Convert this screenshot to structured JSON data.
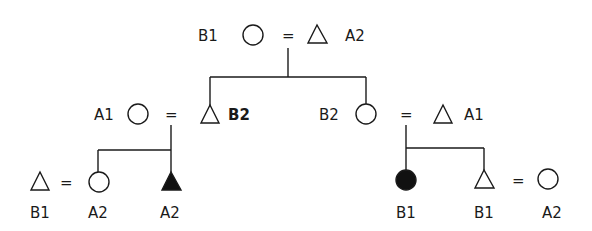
{
  "diagram": {
    "type": "kinship-pedigree",
    "legend_symbols": {
      "circle": "female",
      "triangle": "male",
      "equals": "marriage",
      "filled": "ego/highlighted"
    },
    "generation1": {
      "female": {
        "label": "B1"
      },
      "marriage_sign": "=",
      "male": {
        "label": "A2"
      }
    },
    "generation2": {
      "left_couple": {
        "female": {
          "label": "A1"
        },
        "marriage_sign": "=",
        "male": {
          "label": "B2"
        }
      },
      "right_couple": {
        "female": {
          "label": "B2"
        },
        "marriage_sign": "=",
        "male": {
          "label": "A1"
        }
      }
    },
    "generation3": {
      "left": {
        "spouse_male": {
          "label": "B1"
        },
        "marriage_sign": "=",
        "daughter": {
          "label": "A2"
        },
        "son_filled": {
          "label": "A2"
        }
      },
      "right": {
        "daughter_filled": {
          "label": "B1"
        },
        "son": {
          "label": "B1"
        },
        "marriage_sign": "=",
        "spouse_female": {
          "label": "A2"
        }
      }
    }
  }
}
